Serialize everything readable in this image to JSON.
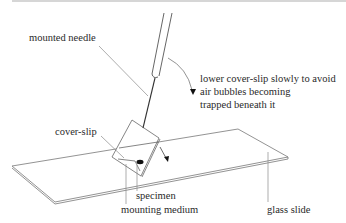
{
  "diagram": {
    "labels": {
      "mounted_needle": "mounted needle",
      "instruction_line1": "lower cover-slip slowly to avoid",
      "instruction_line2": "air bubbles becoming",
      "instruction_line3": "trapped beneath it",
      "cover_slip": "cover-slip",
      "specimen": "specimen",
      "mounting_medium": "mounting medium",
      "glass_slide": "glass slide"
    },
    "colors": {
      "line": "#555555",
      "leader": "#8a8a8a",
      "text": "#2a2a2a",
      "specimen": "#111111"
    }
  }
}
